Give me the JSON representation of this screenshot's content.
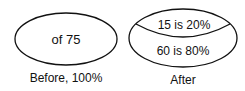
{
  "before": {
    "ellipse_text": "of 75",
    "caption": "Before, 100%"
  },
  "after": {
    "top_text": "15 is 20%",
    "bottom_text": "60 is 80%",
    "caption": "After"
  },
  "colors": {
    "stroke": "#111111",
    "background": "#ffffff"
  }
}
